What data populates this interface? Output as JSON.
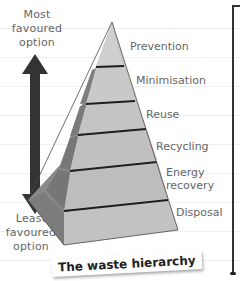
{
  "diagram": {
    "title": "The waste hierarchy",
    "top_label": [
      "Most",
      "favoured",
      "option"
    ],
    "bottom_label": [
      "Least",
      "favoured",
      "option"
    ],
    "tiers": [
      {
        "label": "Prevention"
      },
      {
        "label": "Minimisation"
      },
      {
        "label": "Reuse"
      },
      {
        "label": "Recycling"
      },
      {
        "label_lines": [
          "Energy",
          "recovery"
        ]
      },
      {
        "label": "Disposal"
      }
    ],
    "arrow": "double-headed-vertical-arrow",
    "colors": {
      "pyramid_face": "#c4c4c4",
      "pyramid_side": "#8a8a8a",
      "tier_divider": "#1e1e1e",
      "arrow": "#333333",
      "label_text": "#666666"
    }
  }
}
